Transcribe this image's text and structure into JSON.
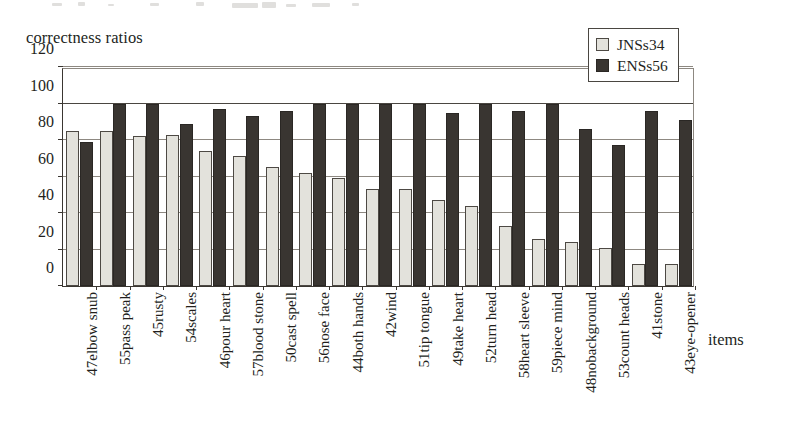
{
  "chart_data": {
    "type": "bar",
    "title": "",
    "ylabel": "correctness ratios",
    "xlabel": "items",
    "ylim": [
      0,
      120
    ],
    "yticks": [
      0,
      20,
      40,
      60,
      80,
      100,
      120
    ],
    "grid": true,
    "legend_position": "top-right",
    "categories": [
      "47elbow snub",
      "55pass peak",
      "45rusty",
      "54scales",
      "46pour heart",
      "57blood  stone",
      "50cast spell",
      "56nose face",
      "44both hands",
      "42wind",
      "51tip tongue",
      "49take heart",
      "52turn head",
      "58heart sleeve",
      "59piece mind",
      "48nobackground",
      "53count heads",
      "41stone",
      "43eye-opener"
    ],
    "series": [
      {
        "name": "JNSs34",
        "color": "#e3e2dc",
        "values": [
          85,
          85,
          82,
          83,
          74,
          71,
          65,
          62,
          59,
          53,
          53,
          47,
          44,
          33,
          26,
          24,
          21,
          12,
          12
        ]
      },
      {
        "name": "ENSs56",
        "color": "#393531",
        "values": [
          79,
          100,
          100,
          89,
          97,
          93,
          96,
          100,
          100,
          100,
          100,
          95,
          100,
          96,
          100,
          86,
          77,
          96,
          91
        ]
      }
    ]
  }
}
